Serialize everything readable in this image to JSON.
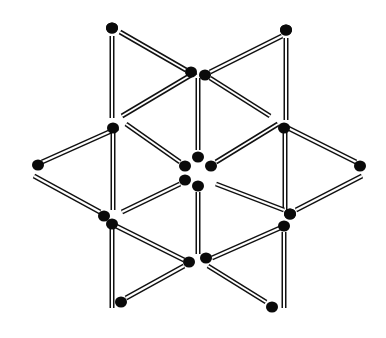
{
  "figure": {
    "background": "#ffffff",
    "stick_color": "#111111",
    "stick_fill": "#ffffff",
    "head_color": "#0a0a0a",
    "matchsticks": [
      {
        "id": "m1",
        "from": [
          112,
          36
        ],
        "to": [
          112,
          118
        ],
        "head": [
          112,
          28
        ]
      },
      {
        "id": "m2",
        "from": [
          120,
          32
        ],
        "to": [
          186,
          70
        ],
        "head": [
          112,
          28
        ]
      },
      {
        "id": "m3",
        "from": [
          282,
          36
        ],
        "to": [
          210,
          72
        ],
        "head": [
          286,
          30
        ]
      },
      {
        "id": "m4",
        "from": [
          286,
          38
        ],
        "to": [
          286,
          120
        ],
        "head": [
          286,
          30
        ]
      },
      {
        "id": "m5",
        "from": [
          198,
          78
        ],
        "to": [
          198,
          150
        ],
        "head": [
          198,
          157
        ]
      },
      {
        "id": "m6",
        "from": [
          196,
          72
        ],
        "to": [
          122,
          116
        ],
        "head": [
          191,
          72
        ]
      },
      {
        "id": "m7",
        "from": [
          210,
          78
        ],
        "to": [
          270,
          116
        ],
        "head": [
          205,
          75
        ]
      },
      {
        "id": "m8",
        "from": [
          118,
          128
        ],
        "to": [
          42,
          162
        ],
        "head": [
          38,
          165
        ]
      },
      {
        "id": "m9",
        "from": [
          126,
          124
        ],
        "to": [
          180,
          162
        ],
        "head": [
          185,
          166
        ]
      },
      {
        "id": "m10",
        "from": [
          278,
          124
        ],
        "to": [
          216,
          162
        ],
        "head": [
          211,
          166
        ]
      },
      {
        "id": "m11",
        "from": [
          288,
          128
        ],
        "to": [
          356,
          162
        ],
        "head": [
          360,
          166
        ]
      },
      {
        "id": "m12",
        "from": [
          113,
          130
        ],
        "to": [
          113,
          210
        ],
        "head": [
          113,
          128
        ]
      },
      {
        "id": "m13",
        "from": [
          285,
          130
        ],
        "to": [
          285,
          210
        ],
        "head": [
          284,
          128
        ]
      },
      {
        "id": "m14",
        "from": [
          34,
          176
        ],
        "to": [
          100,
          212
        ],
        "head": [
          104,
          216
        ]
      },
      {
        "id": "m15",
        "from": [
          122,
          212
        ],
        "to": [
          180,
          184
        ],
        "head": [
          185,
          180
        ]
      },
      {
        "id": "m16",
        "from": [
          216,
          184
        ],
        "to": [
          284,
          210
        ],
        "head": [
          290,
          214
        ]
      },
      {
        "id": "m17",
        "from": [
          362,
          176
        ],
        "to": [
          296,
          210
        ],
        "head": [
          290,
          214
        ]
      },
      {
        "id": "m18",
        "from": [
          198,
          192
        ],
        "to": [
          198,
          254
        ],
        "head": [
          198,
          186
        ]
      },
      {
        "id": "m19",
        "from": [
          116,
          226
        ],
        "to": [
          184,
          260
        ],
        "head": [
          189,
          262
        ]
      },
      {
        "id": "m20",
        "from": [
          280,
          228
        ],
        "to": [
          212,
          258
        ],
        "head": [
          206,
          258
        ]
      },
      {
        "id": "m21",
        "from": [
          112,
          226
        ],
        "to": [
          112,
          308
        ],
        "head": [
          112,
          224
        ]
      },
      {
        "id": "m22",
        "from": [
          284,
          232
        ],
        "to": [
          284,
          308
        ],
        "head": [
          284,
          226
        ]
      },
      {
        "id": "m23",
        "from": [
          184,
          266
        ],
        "to": [
          126,
          298
        ],
        "head": [
          121,
          302
        ]
      },
      {
        "id": "m24",
        "from": [
          208,
          266
        ],
        "to": [
          266,
          302
        ],
        "head": [
          272,
          307
        ]
      }
    ]
  }
}
